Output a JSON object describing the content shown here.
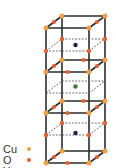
{
  "diagram": {
    "type": "crystal-unit-cell",
    "colors": {
      "Cu": "#f0a040",
      "O": "#e8602c",
      "Y": "#3c7a3c",
      "Ba": "#2a1a50",
      "bond": "#2b2b2b",
      "dashed": "#555555"
    }
  },
  "legend": {
    "items": [
      {
        "label": "Cu",
        "color": "#f0a040"
      },
      {
        "label": "O",
        "color": "#e8602c"
      },
      {
        "label": "Y",
        "color": "#3c7a3c"
      },
      {
        "label": "Ba",
        "color": "#2a1a50"
      }
    ]
  }
}
